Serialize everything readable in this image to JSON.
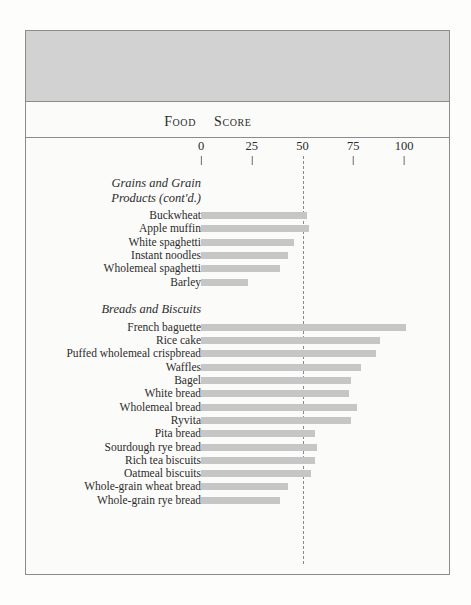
{
  "table": {
    "headers": {
      "food": "Food",
      "score": "Score"
    }
  },
  "chart_data": {
    "type": "bar",
    "orientation": "horizontal",
    "title": "",
    "xlabel": "Score",
    "ylabel": "Food",
    "xlim": [
      0,
      100
    ],
    "xticks": [
      0,
      25,
      50,
      75,
      100
    ],
    "xtick_labels": [
      "0",
      "25",
      "50",
      "75",
      "100"
    ],
    "grid": false,
    "reference_line": 50,
    "legend": "none",
    "bar_color": "#c6c6c6",
    "groups": [
      {
        "name": "Grains and Grain Products (cont'd.)",
        "name_line1": "Grains and Grain",
        "name_line2": "Products (cont'd.)",
        "categories": [
          "Buckwheat",
          "Apple muffin",
          "White spaghetti",
          "Instant noodles",
          "Wholemeal spaghetti",
          "Barley"
        ],
        "values": [
          52,
          53,
          46,
          43,
          39,
          23
        ]
      },
      {
        "name": "Breads and Biscuits",
        "name_line1": "Breads and Biscuits",
        "name_line2": "",
        "categories": [
          "French baguette",
          "Rice cake",
          "Puffed wholemeal crispbread",
          "Waffles",
          "Bagel",
          "White bread",
          "Wholemeal bread",
          "Ryvita",
          "Pita bread",
          "Sourdough rye bread",
          "Rich tea biscuits",
          "Oatmeal biscuits",
          "Whole-grain wheat bread",
          "Whole-grain rye bread"
        ],
        "values": [
          101,
          88,
          86,
          79,
          74,
          73,
          77,
          74,
          56,
          57,
          56,
          54,
          43,
          39
        ]
      }
    ]
  }
}
